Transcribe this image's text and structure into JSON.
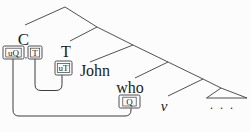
{
  "diagram": {
    "background": "#fcfcfc",
    "line_color": "#3d3d3d",
    "text_color": "#1b1b1b",
    "labels": {
      "c": "C",
      "t": "T",
      "john": "John",
      "who": "who",
      "v": "v",
      "ellipsis": ". . ."
    },
    "features": {
      "uq": "uQ",
      "t": "T",
      "separator": ",",
      "ut": "uT",
      "q": "Q"
    }
  }
}
